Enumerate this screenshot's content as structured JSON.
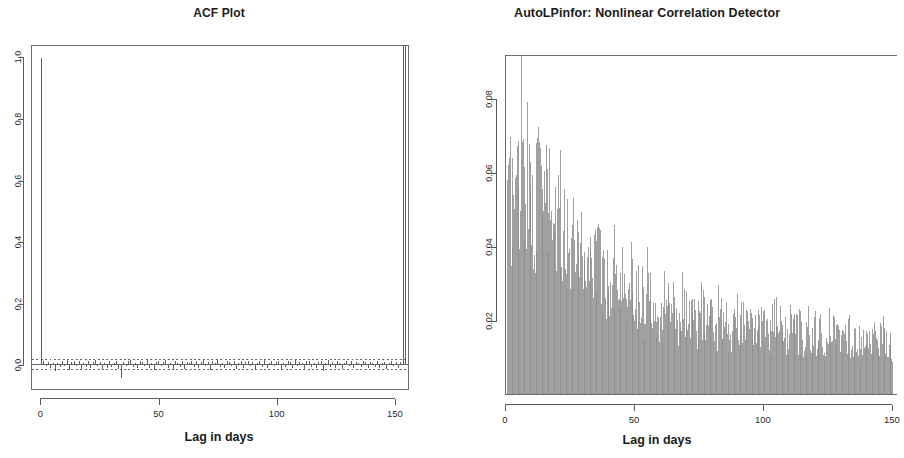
{
  "figure": {
    "width": 876,
    "height": 458,
    "background": "#ffffff",
    "panels": 2
  },
  "colors": {
    "axis": "#5a5a5a",
    "text": "#1a1a1a",
    "acf_spike": "#555555",
    "acf_zero_line": "#555555",
    "conf_band": "#555555",
    "hist_bar": "#8a8a8a"
  },
  "chart_data": [
    {
      "id": "acf-plot",
      "type": "bar",
      "title": "ACF Plot",
      "xlabel": "Lag in days",
      "ylabel": "",
      "xlim": [
        -4,
        156
      ],
      "ylim": [
        -0.08,
        1.04
      ],
      "xticks": [
        0,
        50,
        100,
        150
      ],
      "xtick_labels": [
        "0",
        "50",
        "100",
        "150"
      ],
      "yticks": [
        0.0,
        0.2,
        0.4,
        0.6,
        0.8,
        1.0
      ],
      "ytick_labels": [
        "0.0",
        "0.2",
        "0.4",
        "0.6",
        "0.8",
        "1.0"
      ],
      "grid": false,
      "legend": "none",
      "zero_line": 0.0,
      "confidence_band": [
        -0.0155,
        0.0155
      ],
      "confidence_band_style": "dotted",
      "x": [
        0,
        1,
        2,
        3,
        4,
        5,
        6,
        7,
        8,
        9,
        10,
        11,
        12,
        13,
        14,
        15,
        16,
        17,
        18,
        19,
        20,
        21,
        22,
        23,
        24,
        25,
        26,
        27,
        28,
        29,
        30,
        31,
        32,
        33,
        34,
        35,
        36,
        37,
        38,
        39,
        40,
        41,
        42,
        43,
        44,
        45,
        46,
        47,
        48,
        49,
        50,
        51,
        52,
        53,
        54,
        55,
        56,
        57,
        58,
        59,
        60,
        61,
        62,
        63,
        64,
        65,
        66,
        67,
        68,
        69,
        70,
        71,
        72,
        73,
        74,
        75,
        76,
        77,
        78,
        79,
        80,
        81,
        82,
        83,
        84,
        85,
        86,
        87,
        88,
        89,
        90,
        91,
        92,
        93,
        94,
        95,
        96,
        97,
        98,
        99,
        100,
        101,
        102,
        103,
        104,
        105,
        106,
        107,
        108,
        109,
        110,
        111,
        112,
        113,
        114,
        115,
        116,
        117,
        118,
        119,
        120,
        121,
        122,
        123,
        124,
        125,
        126,
        127,
        128,
        129,
        130,
        131,
        132,
        133,
        134,
        135,
        136,
        137,
        138,
        139,
        140,
        141,
        142,
        143,
        144,
        145,
        146,
        147,
        148,
        149,
        150,
        151,
        152,
        153,
        154,
        155
      ],
      "values": [
        1.0,
        0.012,
        -0.005,
        0.008,
        -0.013,
        0.004,
        -0.022,
        0.006,
        -0.009,
        0.011,
        -0.004,
        0.014,
        -0.017,
        0.009,
        0.013,
        -0.006,
        0.01,
        -0.019,
        0.005,
        -0.008,
        0.012,
        -0.011,
        0.007,
        0.015,
        -0.005,
        0.009,
        -0.014,
        0.004,
        -0.01,
        0.013,
        -0.007,
        0.006,
        0.011,
        -0.016,
        -0.045,
        0.008,
        -0.004,
        0.012,
        0.014,
        -0.009,
        0.005,
        -0.013,
        0.01,
        0.007,
        -0.006,
        0.016,
        -0.011,
        0.004,
        -0.018,
        0.009,
        0.012,
        -0.005,
        0.008,
        0.015,
        -0.01,
        0.006,
        -0.014,
        0.011,
        0.004,
        -0.007,
        0.013,
        -0.016,
        0.009,
        0.005,
        0.012,
        -0.008,
        0.01,
        -0.012,
        0.007,
        0.014,
        -0.005,
        0.009,
        -0.018,
        0.011,
        0.006,
        0.016,
        -0.009,
        0.004,
        -0.013,
        0.012,
        0.008,
        -0.006,
        0.01,
        -0.015,
        0.005,
        0.013,
        -0.01,
        0.007,
        0.011,
        -0.004,
        0.009,
        -0.017,
        0.006,
        0.012,
        -0.008,
        0.014,
        -0.011,
        0.005,
        0.01,
        -0.006,
        0.008,
        0.013,
        -0.014,
        0.004,
        -0.009,
        0.011,
        0.007,
        -0.012,
        0.015,
        -0.005,
        0.009,
        0.006,
        -0.016,
        0.01,
        0.012,
        -0.008,
        0.004,
        -0.013,
        0.008,
        0.011,
        -0.022,
        0.005,
        0.014,
        -0.007,
        0.009,
        -0.01,
        0.012,
        0.006,
        -0.015,
        0.004,
        0.01,
        -0.006,
        0.013,
        -0.011,
        0.008,
        0.005,
        -0.009,
        0.011,
        0.007,
        -0.013,
        0.009,
        0.004,
        -0.007,
        0.012,
        -0.01,
        0.006,
        0.008,
        -0.014,
        0.005,
        0.01,
        -0.006,
        0.009,
        -0.011,
        0.007
      ]
    },
    {
      "id": "autolpinfor-plot",
      "type": "bar",
      "title": "AutoLPinfor: Nonlinear Correlation Detector",
      "xlabel": "Lag in days",
      "ylabel": "",
      "xlim": [
        0,
        152
      ],
      "ylim": [
        0,
        0.092
      ],
      "xticks": [
        0,
        50,
        100,
        150
      ],
      "xtick_labels": [
        "0",
        "50",
        "100",
        "150"
      ],
      "yticks": [
        0.02,
        0.04,
        0.06,
        0.08
      ],
      "ytick_labels": [
        "0.02",
        "0.04",
        "0.06",
        "0.08"
      ],
      "grid": false,
      "legend": "none",
      "x": [
        1,
        2,
        3,
        4,
        5,
        6,
        7,
        8,
        9,
        10,
        11,
        12,
        13,
        14,
        15,
        16,
        17,
        18,
        19,
        20,
        21,
        22,
        23,
        24,
        25,
        26,
        27,
        28,
        29,
        30,
        31,
        32,
        33,
        34,
        35,
        36,
        37,
        38,
        39,
        40,
        41,
        42,
        43,
        44,
        45,
        46,
        47,
        48,
        49,
        50,
        51,
        52,
        53,
        54,
        55,
        56,
        57,
        58,
        59,
        60,
        61,
        62,
        63,
        64,
        65,
        66,
        67,
        68,
        69,
        70,
        71,
        72,
        73,
        74,
        75,
        76,
        77,
        78,
        79,
        80,
        81,
        82,
        83,
        84,
        85,
        86,
        87,
        88,
        89,
        90,
        91,
        92,
        93,
        94,
        95,
        96,
        97,
        98,
        99,
        100,
        101,
        102,
        103,
        104,
        105,
        106,
        107,
        108,
        109,
        110,
        111,
        112,
        113,
        114,
        115,
        116,
        117,
        118,
        119,
        120,
        121,
        122,
        123,
        124,
        125,
        126,
        127,
        128,
        129,
        130,
        131,
        132,
        133,
        134,
        135,
        136,
        137,
        138,
        139,
        140,
        141,
        142,
        143,
        144,
        145,
        146,
        147,
        148,
        149,
        150
      ],
      "values": [
        0.056,
        0.059,
        0.0615,
        0.0625,
        0.064,
        0.09,
        0.07,
        0.0655,
        0.062,
        0.06,
        0.058,
        0.056,
        0.066,
        0.064,
        0.06,
        0.057,
        0.0545,
        0.0525,
        0.0505,
        0.049,
        0.056,
        0.052,
        0.05,
        0.047,
        0.0445,
        0.043,
        0.052,
        0.049,
        0.0465,
        0.044,
        0.042,
        0.04,
        0.0385,
        0.045,
        0.042,
        0.04,
        0.038,
        0.036,
        0.0345,
        0.033,
        0.0415,
        0.039,
        0.037,
        0.035,
        0.033,
        0.0315,
        0.03,
        0.037,
        0.035,
        0.033,
        0.031,
        0.0295,
        0.028,
        0.0265,
        0.034,
        0.032,
        0.03,
        0.0285,
        0.027,
        0.0255,
        0.0245,
        0.031,
        0.029,
        0.0275,
        0.026,
        0.0245,
        0.0235,
        0.0225,
        0.028,
        0.0265,
        0.025,
        0.0238,
        0.0228,
        0.0218,
        0.0208,
        0.0262,
        0.0248,
        0.0236,
        0.0225,
        0.0215,
        0.0205,
        0.0196,
        0.0248,
        0.0236,
        0.0225,
        0.0215,
        0.0205,
        0.0197,
        0.0188,
        0.0238,
        0.0226,
        0.0216,
        0.0207,
        0.0198,
        0.019,
        0.0182,
        0.023,
        0.022,
        0.021,
        0.02,
        0.0192,
        0.0184,
        0.0176,
        0.0222,
        0.0212,
        0.0203,
        0.0194,
        0.0186,
        0.0178,
        0.0171,
        0.0215,
        0.0205,
        0.0196,
        0.0188,
        0.018,
        0.0172,
        0.0165,
        0.0208,
        0.0198,
        0.019,
        0.0182,
        0.0174,
        0.0167,
        0.016,
        0.02,
        0.0191,
        0.0183,
        0.0175,
        0.0168,
        0.0161,
        0.0155,
        0.0193,
        0.0185,
        0.0177,
        0.017,
        0.0163,
        0.0157,
        0.0151,
        0.0186,
        0.0178,
        0.0171,
        0.0164,
        0.0158,
        0.0152,
        0.0146,
        0.018,
        0.0172,
        0.0165,
        0.0158,
        0.0152
      ]
    }
  ]
}
